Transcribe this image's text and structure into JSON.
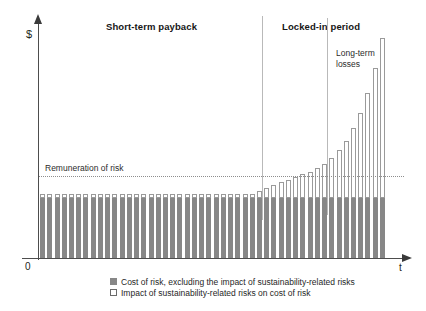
{
  "axes": {
    "y_label": "$",
    "x_label": "t",
    "origin_label": "0"
  },
  "sections": [
    {
      "id": "short-term",
      "label": "Short-term payback"
    },
    {
      "id": "locked-in",
      "label": "Locked-in period"
    }
  ],
  "annotations": {
    "remuneration": "Remuneration of risk",
    "long_term_losses_line1": "Long-term",
    "long_term_losses_line2": "losses"
  },
  "legend": {
    "items": [
      {
        "swatch": "filled",
        "label": "Cost of risk, excluding the impact of sustainability-related risks"
      },
      {
        "swatch": "outline",
        "label": "Impact of sustainability-related risks on cost of risk"
      }
    ]
  },
  "colors": {
    "bar_base": "#878787",
    "bar_cap_fill": "#ffffff",
    "bar_cap_stroke": "#9a9a9a",
    "axis": "#4d4d4d",
    "divider": "#b9b9b9",
    "remuneration_line": "#8d8d8d",
    "text": "#231f20"
  },
  "chart_data": {
    "type": "bar",
    "title": "",
    "subtitle": "",
    "xlabel": "t",
    "ylabel": "$",
    "stacked": true,
    "grid": false,
    "legend_position": "bottom",
    "ylim": [
      0,
      238
    ],
    "xlim": [
      0,
      48
    ],
    "reference_lines": [
      {
        "name": "Remuneration of risk",
        "orientation": "horizontal",
        "value": 82,
        "style": "dotted"
      },
      {
        "name": "Short-term payback / Locked-in period boundary",
        "orientation": "vertical",
        "value": 30,
        "style": "solid"
      },
      {
        "name": "Long-term losses onset",
        "orientation": "vertical",
        "value": 39,
        "style": "solid"
      }
    ],
    "categories": [
      1,
      2,
      3,
      4,
      5,
      6,
      7,
      8,
      9,
      10,
      11,
      12,
      13,
      14,
      15,
      16,
      17,
      18,
      19,
      20,
      21,
      22,
      23,
      24,
      25,
      26,
      27,
      28,
      29,
      30,
      31,
      32,
      33,
      34,
      35,
      36,
      37,
      38,
      39,
      40,
      41,
      42,
      43,
      44,
      45,
      46,
      47,
      48
    ],
    "series": [
      {
        "name": "Cost of risk, excluding the impact of sustainability-related risks",
        "color": "#878787",
        "values": [
          60,
          60,
          60,
          60,
          60,
          60,
          60,
          60,
          60,
          60,
          60,
          60,
          60,
          60,
          60,
          60,
          60,
          60,
          60,
          60,
          60,
          60,
          60,
          60,
          60,
          60,
          60,
          60,
          60,
          60,
          60,
          60,
          60,
          60,
          60,
          60,
          60,
          60,
          60,
          60,
          60,
          60,
          60,
          60,
          60,
          60,
          60,
          60
        ]
      },
      {
        "name": "Impact of sustainability-related risks on cost of risk",
        "color": "#ffffff",
        "values": [
          4,
          4,
          4,
          4,
          4,
          4,
          4,
          4,
          4,
          4,
          4,
          4,
          4,
          4,
          4,
          4,
          4,
          4,
          4,
          4,
          4,
          4,
          4,
          4,
          4,
          4,
          4,
          4,
          4,
          4,
          7,
          10,
          13,
          16,
          18,
          21,
          24,
          26,
          30,
          34,
          40,
          48,
          57,
          70,
          85,
          105,
          130,
          160
        ]
      }
    ]
  }
}
